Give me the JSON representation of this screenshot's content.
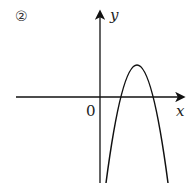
{
  "figure": {
    "panel_label": "②",
    "origin_label": "0",
    "x_axis_label": "x",
    "y_axis_label": "y",
    "curve": "downward-opening parabola with vertex in first quadrant, both roots positive, y-intercept negative"
  },
  "colors": {
    "stroke": "#111111",
    "background": "#ffffff"
  }
}
